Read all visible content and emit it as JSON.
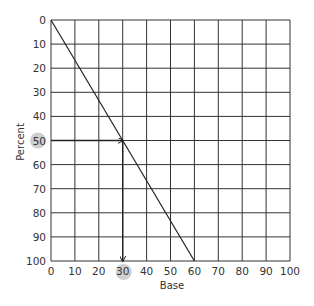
{
  "chart_data": {
    "type": "line",
    "title": "",
    "xlabel": "Base",
    "ylabel": "Percent",
    "xlim": [
      0,
      100
    ],
    "ylim": [
      0,
      100
    ],
    "y_inverted": true,
    "grid": true,
    "x_ticks": [
      "0",
      "10",
      "20",
      "30",
      "40",
      "50",
      "60",
      "70",
      "80",
      "90",
      "100"
    ],
    "y_ticks": [
      "0",
      "10",
      "20",
      "30",
      "40",
      "50",
      "60",
      "70",
      "80",
      "90",
      "100"
    ],
    "x_tick_values": [
      0,
      10,
      20,
      30,
      40,
      50,
      60,
      70,
      80,
      90,
      100
    ],
    "y_tick_values": [
      0,
      10,
      20,
      30,
      40,
      50,
      60,
      70,
      80,
      90,
      100
    ],
    "series": [
      {
        "name": "nomogram-line",
        "points": [
          [
            0,
            0
          ],
          [
            60,
            100
          ]
        ]
      }
    ],
    "annotations": {
      "lookup_percent": 50,
      "lookup_base": 30,
      "highlighted_y_tick": "50",
      "highlighted_x_tick": "30",
      "arrow_path": [
        [
          0,
          50
        ],
        [
          30,
          50
        ],
        [
          30,
          100
        ]
      ]
    },
    "colors": {
      "grid": "#333333",
      "line": "#222222",
      "highlight": "#cfcfcf"
    }
  }
}
